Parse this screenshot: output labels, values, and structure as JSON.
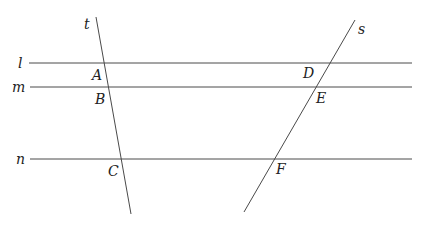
{
  "diagram": {
    "parallel_lines": [
      {
        "name": "l",
        "x1": 29,
        "y1": 63,
        "x2": 412,
        "y2": 63,
        "label_x": 18,
        "label_y": 68
      },
      {
        "name": "m",
        "x1": 30,
        "y1": 87,
        "x2": 412,
        "y2": 87,
        "label_x": 12,
        "label_y": 92
      },
      {
        "name": "n",
        "x1": 30,
        "y1": 159,
        "x2": 412,
        "y2": 159,
        "label_x": 16,
        "label_y": 164
      }
    ],
    "transversals": [
      {
        "name": "t",
        "x1": 96,
        "y1": 17,
        "x2": 131,
        "y2": 214,
        "label_x": 84,
        "label_y": 29
      },
      {
        "name": "s",
        "x1": 355,
        "y1": 20,
        "x2": 244,
        "y2": 212,
        "label_x": 358,
        "label_y": 34
      }
    ],
    "points": [
      {
        "name": "A",
        "x": 92,
        "y": 80
      },
      {
        "name": "B",
        "x": 95,
        "y": 104
      },
      {
        "name": "C",
        "x": 108,
        "y": 176
      },
      {
        "name": "D",
        "x": 303,
        "y": 78
      },
      {
        "name": "E",
        "x": 316,
        "y": 103
      },
      {
        "name": "F",
        "x": 276,
        "y": 174
      }
    ]
  }
}
